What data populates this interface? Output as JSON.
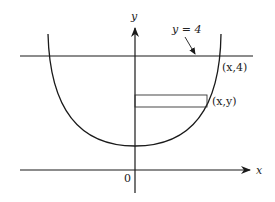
{
  "diagram": {
    "type": "function-graph",
    "axes": {
      "x_label": "x",
      "y_label": "y",
      "origin_label": "0"
    },
    "labels": {
      "line_label": "y = 4",
      "intersection_point": "(x,4)",
      "strip_point": "(x,y)"
    },
    "elements": {
      "horizontal_line": "y = 4",
      "curve": "U-shaped curve symmetric about the y-axis",
      "strip": "horizontal rectangle from y-axis to curve at height y"
    },
    "colors": {
      "stroke": "#1a1a1a",
      "background": "#ffffff"
    }
  }
}
